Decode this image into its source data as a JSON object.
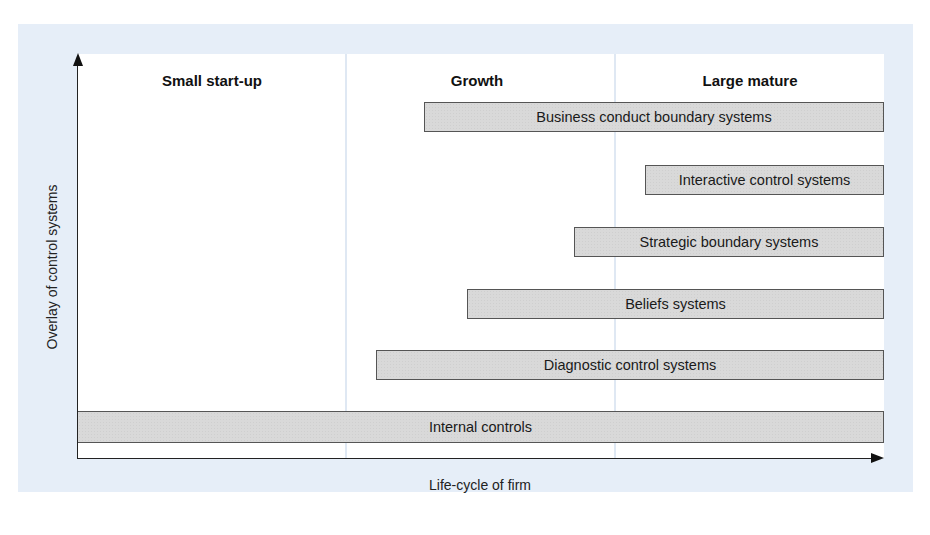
{
  "diagram": {
    "y_axis_label": "Overlay of control systems",
    "x_axis_label": "Life-cycle of firm",
    "stages": [
      {
        "label": "Small start-up"
      },
      {
        "label": "Growth"
      },
      {
        "label": "Large mature"
      }
    ],
    "bars": [
      {
        "label": "Business conduct boundary systems",
        "start_stage": "Growth"
      },
      {
        "label": "Interactive control systems",
        "start_stage": "Large mature"
      },
      {
        "label": "Strategic boundary systems",
        "start_stage": "Growth (late)"
      },
      {
        "label": "Beliefs systems",
        "start_stage": "Growth"
      },
      {
        "label": "Diagnostic control systems",
        "start_stage": "Growth (early)"
      },
      {
        "label": "Internal controls",
        "start_stage": "Small start-up"
      }
    ],
    "colors": {
      "panel_background": "#e6eef8",
      "bar_fill": "#d9d9d9",
      "bar_border": "#555555"
    }
  }
}
